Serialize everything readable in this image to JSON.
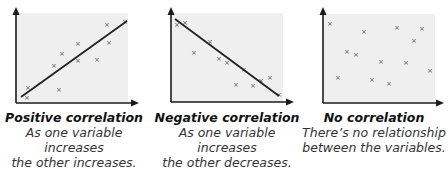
{
  "colors": {
    "plot_background": "#efefef",
    "axis": "#1a1a1a",
    "marker": "#555555",
    "trend_line": "#222222"
  },
  "chart_data": [
    {
      "type": "scatter",
      "title": "Positive correlation",
      "subtitle": "As one variable increases the other increases.",
      "xlabel": "",
      "ylabel": "",
      "marker": "x",
      "points": [
        [
          27,
          97
        ],
        [
          28,
          87
        ],
        [
          59,
          89
        ],
        [
          54,
          65
        ],
        [
          62,
          53
        ],
        [
          78,
          43
        ],
        [
          78,
          60
        ],
        [
          97,
          59
        ],
        [
          107,
          24
        ],
        [
          109,
          42
        ],
        [
          125,
          21
        ]
      ],
      "trend_line": [
        [
          21,
          97
        ],
        [
          127,
          21
        ]
      ]
    },
    {
      "type": "scatter",
      "title": "Negative correlation",
      "subtitle": "As one variable increases the other decreases.",
      "xlabel": "",
      "ylabel": "",
      "marker": "x",
      "points": [
        [
          177,
          24
        ],
        [
          185,
          22
        ],
        [
          194,
          52
        ],
        [
          210,
          41
        ],
        [
          219,
          58
        ],
        [
          227,
          62
        ],
        [
          244,
          69
        ],
        [
          236,
          84
        ],
        [
          253,
          85
        ],
        [
          261,
          80
        ],
        [
          270,
          77
        ],
        [
          279,
          94
        ]
      ],
      "trend_line": [
        [
          175,
          19
        ],
        [
          279,
          96
        ]
      ]
    },
    {
      "type": "scatter",
      "title": "No correlation",
      "subtitle": "There's no relationship between the variables.",
      "xlabel": "",
      "ylabel": "",
      "marker": "x",
      "points": [
        [
          330,
          23
        ],
        [
          364,
          31
        ],
        [
          397,
          27
        ],
        [
          422,
          28
        ],
        [
          414,
          40
        ],
        [
          347,
          51
        ],
        [
          356,
          54
        ],
        [
          381,
          61
        ],
        [
          406,
          62
        ],
        [
          430,
          70
        ],
        [
          338,
          77
        ],
        [
          372,
          79
        ],
        [
          389,
          83
        ]
      ],
      "trend_line": null
    }
  ],
  "captions": [
    {
      "title": "Positive correlation",
      "line1": "As one variable increases",
      "line2": "the other increases."
    },
    {
      "title": "Negative correlation",
      "line1": "As one variable increases",
      "line2": "the other decreases."
    },
    {
      "title": "No correlation",
      "line1": "There’s no relationship",
      "line2": "between the variables."
    }
  ]
}
